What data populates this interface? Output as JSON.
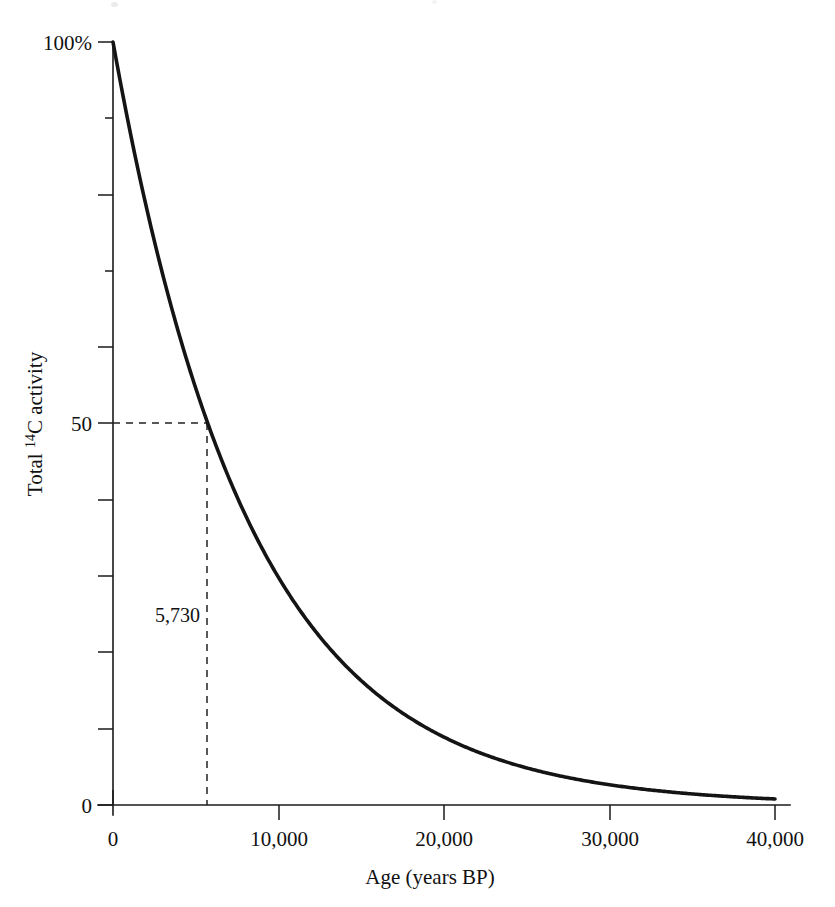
{
  "figure": {
    "background_color": "#ffffff",
    "ink_color": "#141414"
  },
  "chart_data": {
    "type": "line",
    "title": "",
    "subtitle": "",
    "xlabel": "Age (years BP)",
    "ylabel": "Total 14C activity",
    "ylabel_parts": {
      "prefix": "Total ",
      "superscript": "14",
      "suffix": "C activity"
    },
    "xlim": [
      0,
      40000
    ],
    "ylim": [
      0,
      100
    ],
    "grid": false,
    "legend": null,
    "x_tick_labels": [
      "0",
      "10,000",
      "20,000",
      "30,000",
      "40,000"
    ],
    "x_ticks": [
      0,
      10000,
      20000,
      30000,
      40000
    ],
    "y_tick_labels": [
      "0",
      "",
      "",
      "",
      "",
      "50",
      "",
      "",
      "",
      "",
      "100%"
    ],
    "y_ticks": [
      0,
      10,
      20,
      30,
      40,
      50,
      60,
      70,
      80,
      90,
      100
    ],
    "y_labeled_ticks": [
      {
        "value": 0,
        "label": "0"
      },
      {
        "value": 50,
        "label": "50"
      },
      {
        "value": 100,
        "label": "100%"
      }
    ],
    "series": [
      {
        "name": "Radiocarbon decay",
        "model": "exponential decay, half-life 5730 years",
        "half_life": 5730,
        "x": [
          0,
          1000,
          2000,
          3000,
          4000,
          5000,
          5730,
          6000,
          7000,
          8000,
          9000,
          10000,
          11460,
          12000,
          14000,
          16000,
          17190,
          18000,
          20000,
          22000,
          22920,
          24000,
          26000,
          28000,
          28650,
          30000,
          32000,
          34000,
          34380,
          36000,
          38000,
          40000
        ],
        "y": [
          100.0,
          88.6,
          78.5,
          69.6,
          61.7,
          54.6,
          50.0,
          48.4,
          42.9,
          38.0,
          33.7,
          29.8,
          25.0,
          23.5,
          18.5,
          14.6,
          12.5,
          11.5,
          9.1,
          7.2,
          6.25,
          5.6,
          4.5,
          3.5,
          3.125,
          2.8,
          2.2,
          1.7,
          1.56,
          1.4,
          1.1,
          0.85
        ]
      }
    ],
    "annotations": [
      {
        "name": "half-life-guide",
        "label": "5,730",
        "x": 5730,
        "y": 50,
        "style": "dashed crosshair from y-axis at 50 to curve, then down to x-axis"
      }
    ]
  },
  "axis": {
    "y_top_label": "100%",
    "y_mid_label": "50",
    "y_zero_label": "0",
    "x_zero_label": "0",
    "x_labels": [
      "0",
      "10,000",
      "20,000",
      "30,000",
      "40,000"
    ],
    "x_title": "Age (years BP)",
    "y_title_prefix": "Total ",
    "y_title_superscript": "14",
    "y_title_suffix": "C activity"
  },
  "annotation": {
    "half_life_value": "5,730"
  }
}
